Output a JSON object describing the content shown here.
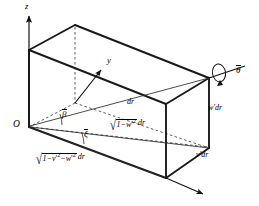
{
  "figure": {
    "type": "3d-geometry-diagram",
    "background_color": "#ffffff",
    "stroke_color": "#1a1a1a"
  },
  "axes": {
    "z": {
      "label": "z",
      "x": 25,
      "y": 3
    },
    "y": {
      "label": "y",
      "x": 108,
      "y": 57
    },
    "origin": {
      "label": "O",
      "x": 14,
      "y": 121
    }
  },
  "angles": {
    "beta": {
      "label": "β",
      "overbar": true,
      "x": 63,
      "y": 115
    },
    "xi": {
      "label": "ξ",
      "overbar": true,
      "x": 85,
      "y": 134
    },
    "theta": {
      "label": "θ",
      "overbar": true,
      "x": 238,
      "y": 72
    }
  },
  "labels": {
    "dr": {
      "text": "dr",
      "x": 128,
      "y": 100
    },
    "w_dr": {
      "text": "w′dr",
      "x": 210,
      "y": 108
    },
    "v_dr": {
      "text": "v′dr",
      "x": 198,
      "y": 155
    },
    "sqrt_w": {
      "radical": "√",
      "radicand_pre": "1−w",
      "radicand_prime": "′",
      "radicand_sup": "2",
      "tail": "dr",
      "x": 112,
      "y": 124
    },
    "sqrt_vw": {
      "radical": "√",
      "radicand_pre": "1−v",
      "radicand_prime1": "′",
      "radicand_sup1": "2",
      "radicand_mid": "−w",
      "radicand_prime2": "′",
      "radicand_sup2": "2",
      "tail": "dr",
      "x": 38,
      "y": 158
    }
  },
  "geometry": {
    "origin_vertex": [
      29,
      127
    ],
    "top_left_vertex": [
      29,
      50
    ],
    "top_back_vertex": [
      75,
      25
    ],
    "top_far_vertex": [
      209,
      78
    ],
    "top_front_vertex": [
      166,
      104
    ],
    "right_vertical_bottom": [
      209,
      148
    ],
    "front_vertical_bottom": [
      166,
      178
    ],
    "arrow_tip": [
      206,
      196
    ]
  }
}
